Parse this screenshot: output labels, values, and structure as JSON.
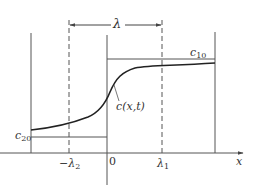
{
  "diagram": {
    "title": "",
    "colors": {
      "line": "#555555",
      "curve": "#222222",
      "text": "#333333",
      "background": "#ffffff"
    },
    "labels": {
      "lambda": "λ",
      "c10": "c",
      "c10_sub": "10",
      "c20": "c",
      "c20_sub": "20",
      "curve": "c(x,t)",
      "neg_lambda2_prefix": "−λ",
      "neg_lambda2_sub": "2",
      "origin": "0",
      "lambda1": "λ",
      "lambda1_sub": "1",
      "x_axis": "x"
    }
  }
}
